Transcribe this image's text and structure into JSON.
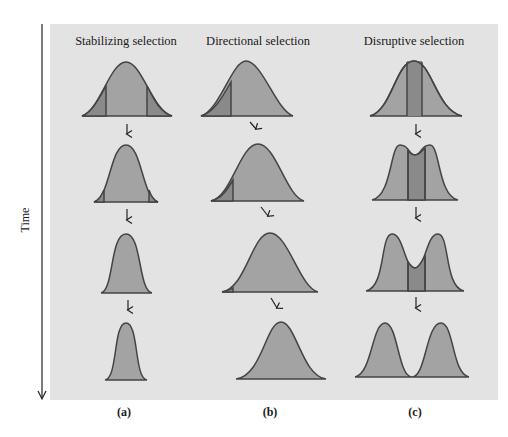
{
  "axis": {
    "label": "Time"
  },
  "columns": [
    {
      "title": "Stabilizing selection",
      "sublabel": "(a)"
    },
    {
      "title": "Directional selection",
      "sublabel": "(b)"
    },
    {
      "title": "Disruptive selection",
      "sublabel": "(c)"
    }
  ],
  "colors": {
    "panel": "#e3e3e3",
    "curve_fill": "#a3a3a3",
    "selected_fill": "#8a8a8a",
    "outline": "#444444"
  }
}
